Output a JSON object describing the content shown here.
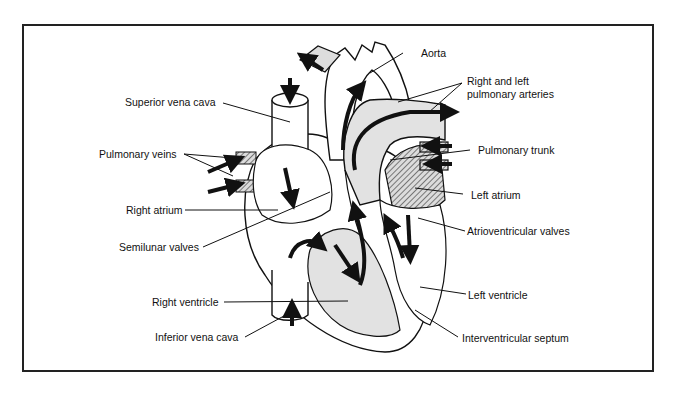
{
  "diagram": {
    "colors": {
      "outline": "#111111",
      "chamber_fill": "#e2e2e2",
      "arrow": "#111111",
      "background": "#ffffff"
    },
    "labels": {
      "aorta": "Aorta",
      "pulmonary_arteries": [
        "Right and left",
        "pulmonary arteries"
      ],
      "superior_vena_cava": "Superior vena cava",
      "pulmonary_veins": "Pulmonary veins",
      "pulmonary_trunk": "Pulmonary trunk",
      "left_atrium": "Left atrium",
      "right_atrium": "Right atrium",
      "atrioventricular_valves": "Atrioventricular valves",
      "semilunar_valves": "Semilunar valves",
      "right_ventricle": "Right ventricle",
      "left_ventricle": "Left ventricle",
      "inferior_vena_cava": "Inferior vena cava",
      "interventricular_septum": "Interventricular septum"
    }
  }
}
